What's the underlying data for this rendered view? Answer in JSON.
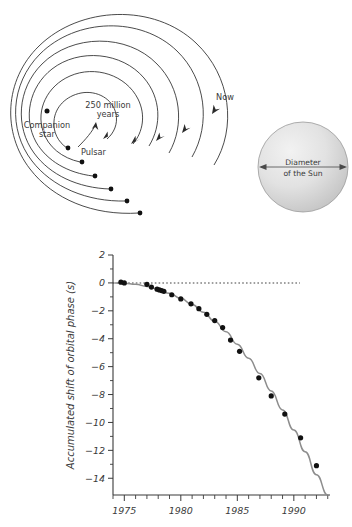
{
  "figure": {
    "title_top": "Binary pulsar orbital decay spiral",
    "title_bottom": "Accumulated orbital phase shift"
  },
  "spiral": {
    "labels": {
      "companion_star": "Companion\nstar",
      "companion_star_line1": "Companion",
      "companion_star_line2": "star",
      "timescale_line1": "250 million",
      "timescale_line2": "years",
      "pulsar": "Pulsar",
      "now": "Now"
    },
    "sun": {
      "caption_line1": "Diameter",
      "caption_line2": "of the Sun"
    },
    "turns": 6,
    "pulsar_marker_count": 6,
    "arrow_count": 5,
    "colors": {
      "orbit_stroke": "#2b2b2b",
      "marker_fill": "#111111",
      "sun_outline": "#9a9a9a",
      "sun_fill_light": "#efefef",
      "sun_fill_dark": "#c9c9c9"
    }
  },
  "chart_data": {
    "type": "line",
    "title": "",
    "xlabel": "",
    "ylabel": "Accumulated shift of orbital phase (s)",
    "xlim": [
      1974.0,
      1993.2
    ],
    "ylim": [
      -15.2,
      2.0
    ],
    "xticks": [
      1975,
      1980,
      1985,
      1990
    ],
    "xtick_labels": [
      "1975",
      "1980",
      "1985",
      "1990"
    ],
    "xticks_minor_step": 1,
    "yticks": [
      2,
      0,
      -2,
      -4,
      -6,
      -8,
      -10,
      -12,
      -14
    ],
    "ytick_labels": [
      "2",
      "0",
      "-2",
      "-4",
      "-6",
      "-8",
      "-10",
      "-12",
      "-14"
    ],
    "yticks_minor": [
      1,
      -1,
      -3,
      -5,
      -7,
      -9,
      -11,
      -13
    ],
    "grid": false,
    "legend": false,
    "zero_reference_line": {
      "value": 0,
      "style": "dotted",
      "x_start": 1974.2,
      "x_end": 1991.8
    },
    "series": [
      {
        "name": "General relativity prediction",
        "style": "line",
        "color": "#8d8d8d",
        "x": [
          1974.2,
          1975.0,
          1976.0,
          1977.0,
          1978.0,
          1979.0,
          1980.0,
          1981.0,
          1982.0,
          1983.0,
          1984.0,
          1985.0,
          1986.0,
          1987.0,
          1988.0,
          1989.0,
          1990.0,
          1991.0,
          1992.0,
          1993.0
        ],
        "y": [
          0.0,
          -0.02,
          -0.1,
          -0.25,
          -0.45,
          -0.75,
          -1.1,
          -1.55,
          -2.1,
          -2.75,
          -3.5,
          -4.4,
          -5.4,
          -6.5,
          -7.75,
          -9.1,
          -10.55,
          -12.1,
          -13.75,
          -15.2
        ]
      },
      {
        "name": "Observed data points",
        "style": "markers",
        "color": "#111111",
        "x": [
          1974.7,
          1975.0,
          1977.0,
          1977.4,
          1977.9,
          1978.1,
          1978.3,
          1978.5,
          1979.2,
          1980.0,
          1980.9,
          1981.6,
          1982.3,
          1983.0,
          1983.7,
          1984.4,
          1985.2,
          1986.9,
          1988.0,
          1989.2,
          1990.6,
          1992.0
        ],
        "y": [
          0.05,
          0.0,
          -0.1,
          -0.3,
          -0.45,
          -0.5,
          -0.55,
          -0.6,
          -0.85,
          -1.15,
          -1.5,
          -1.85,
          -2.25,
          -2.7,
          -3.2,
          -4.1,
          -4.9,
          -6.8,
          -8.1,
          -9.4,
          -11.1,
          -13.1
        ]
      }
    ]
  }
}
